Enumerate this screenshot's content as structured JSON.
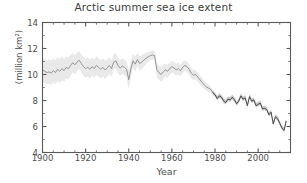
{
  "chart_data": {
    "type": "line",
    "title": "Arctic summer sea ice extent",
    "xlabel": "Year",
    "ylabel": "(million km²)",
    "xlim": [
      1900,
      2015
    ],
    "ylim": [
      4,
      14
    ],
    "xticks": [
      1900,
      1920,
      1940,
      1960,
      1980,
      2000
    ],
    "xtick_labels": [
      "1900",
      "1920",
      "1940",
      "1960",
      "1980",
      "2000"
    ],
    "yticks": [
      4,
      6,
      8,
      10,
      12,
      14
    ],
    "ytick_labels": [
      "4",
      "6",
      "8",
      "10",
      "12",
      "14"
    ],
    "minor_xtick_interval": 5,
    "minor_ytick_interval": 1,
    "grid": false,
    "legend": null,
    "series": [
      {
        "name": "Arctic summer sea ice extent",
        "style": "line-with-uncertainty-band",
        "line_color": "#8c8c8c",
        "line_color_recent": "#4a4a4a",
        "band_color": "#c9c9c9",
        "band_opacity": 0.45,
        "recent_period_start": 1979,
        "x": [
          1900,
          1901,
          1902,
          1903,
          1904,
          1905,
          1906,
          1907,
          1908,
          1909,
          1910,
          1911,
          1912,
          1913,
          1914,
          1915,
          1916,
          1917,
          1918,
          1919,
          1920,
          1921,
          1922,
          1923,
          1924,
          1925,
          1926,
          1927,
          1928,
          1929,
          1930,
          1931,
          1932,
          1933,
          1934,
          1935,
          1936,
          1937,
          1938,
          1939,
          1940,
          1941,
          1942,
          1943,
          1944,
          1945,
          1946,
          1947,
          1948,
          1949,
          1950,
          1951,
          1952,
          1953,
          1954,
          1955,
          1956,
          1957,
          1958,
          1959,
          1960,
          1961,
          1962,
          1963,
          1964,
          1965,
          1966,
          1967,
          1968,
          1969,
          1970,
          1971,
          1972,
          1973,
          1974,
          1975,
          1976,
          1977,
          1978,
          1979,
          1980,
          1981,
          1982,
          1983,
          1984,
          1985,
          1986,
          1987,
          1988,
          1989,
          1990,
          1991,
          1992,
          1993,
          1994,
          1995,
          1996,
          1997,
          1998,
          1999,
          2000,
          2001,
          2002,
          2003,
          2004,
          2005,
          2006,
          2007,
          2008,
          2009,
          2010,
          2011,
          2012,
          2013
        ],
        "values": [
          10.35,
          10.25,
          10.15,
          10.2,
          10.1,
          10.3,
          10.15,
          10.4,
          10.25,
          10.45,
          10.3,
          10.55,
          10.45,
          10.7,
          10.9,
          10.75,
          10.95,
          11.1,
          10.85,
          10.6,
          10.45,
          10.55,
          10.4,
          10.6,
          10.45,
          10.7,
          10.55,
          10.4,
          10.55,
          10.35,
          10.5,
          10.7,
          10.45,
          10.95,
          11.05,
          10.7,
          10.5,
          10.65,
          10.55,
          10.4,
          9.6,
          10.45,
          11.05,
          10.8,
          11.15,
          10.85,
          10.95,
          11.1,
          11.25,
          11.35,
          11.45,
          11.5,
          11.45,
          10.35,
          10.15,
          10.0,
          10.2,
          10.35,
          10.25,
          10.45,
          10.6,
          10.5,
          10.35,
          10.45,
          10.3,
          10.55,
          10.7,
          10.6,
          10.4,
          10.1,
          9.95,
          10.0,
          9.8,
          9.6,
          9.4,
          9.2,
          9.05,
          8.95,
          8.85,
          8.6,
          8.45,
          8.15,
          8.35,
          8.25,
          7.95,
          7.85,
          8.1,
          8.05,
          8.25,
          8.05,
          7.75,
          7.95,
          8.35,
          8.1,
          8.2,
          7.6,
          8.3,
          7.95,
          8.05,
          7.6,
          7.7,
          7.8,
          7.35,
          7.4,
          7.3,
          6.9,
          7.1,
          6.2,
          6.75,
          6.6,
          6.25,
          5.9,
          5.7,
          6.4
        ],
        "band_upper": [
          11.3,
          11.2,
          11.1,
          11.15,
          11.05,
          11.25,
          11.1,
          11.35,
          11.2,
          11.4,
          11.2,
          11.4,
          11.3,
          11.5,
          11.65,
          11.5,
          11.65,
          11.8,
          11.55,
          11.35,
          11.2,
          11.3,
          11.15,
          11.3,
          11.15,
          11.4,
          11.25,
          11.1,
          11.25,
          11.05,
          11.15,
          11.35,
          11.1,
          11.55,
          11.65,
          11.3,
          11.1,
          11.25,
          11.15,
          11.0,
          10.35,
          11.1,
          11.6,
          11.4,
          11.65,
          11.4,
          11.5,
          11.6,
          11.7,
          11.75,
          11.8,
          11.85,
          11.8,
          10.9,
          10.7,
          10.55,
          10.75,
          10.85,
          10.75,
          10.9,
          11.05,
          10.95,
          10.8,
          10.9,
          10.75,
          11.0,
          11.1,
          11.0,
          10.8,
          10.5,
          10.35,
          10.35,
          10.15,
          9.95,
          9.75,
          9.5,
          9.35,
          9.25,
          9.1,
          8.8,
          8.6,
          8.35,
          8.55,
          8.45,
          8.15,
          8.05,
          8.3,
          8.25,
          8.45,
          8.25,
          7.95,
          8.15,
          8.55,
          8.3,
          8.4,
          7.8,
          8.5,
          8.15,
          8.25,
          7.8,
          7.9,
          8.0,
          7.55,
          7.6,
          7.5,
          7.1,
          7.3,
          6.4,
          6.95,
          6.8,
          6.45,
          6.1,
          5.9,
          6.6
        ],
        "band_lower": [
          9.4,
          9.35,
          9.25,
          9.3,
          9.2,
          9.4,
          9.25,
          9.5,
          9.35,
          9.55,
          9.45,
          9.7,
          9.6,
          9.9,
          10.15,
          10.0,
          10.25,
          10.4,
          10.15,
          9.9,
          9.75,
          9.85,
          9.7,
          9.9,
          9.75,
          10.0,
          9.85,
          9.7,
          9.85,
          9.65,
          9.85,
          10.05,
          9.8,
          10.35,
          10.45,
          10.1,
          9.9,
          10.05,
          9.95,
          9.8,
          8.85,
          9.8,
          10.5,
          10.2,
          10.65,
          10.3,
          10.4,
          10.6,
          10.8,
          10.95,
          11.1,
          11.15,
          11.1,
          9.8,
          9.6,
          9.45,
          9.65,
          9.85,
          9.75,
          9.95,
          10.15,
          10.05,
          9.9,
          10.0,
          9.85,
          10.1,
          10.3,
          10.2,
          10.0,
          9.7,
          9.55,
          9.65,
          9.45,
          9.25,
          9.05,
          8.9,
          8.75,
          8.65,
          8.6,
          8.4,
          8.3,
          8.0,
          8.2,
          8.1,
          7.8,
          7.7,
          7.95,
          7.9,
          8.1,
          7.9,
          7.6,
          7.8,
          8.2,
          7.95,
          8.05,
          7.45,
          8.15,
          7.8,
          7.9,
          7.45,
          7.55,
          7.65,
          7.2,
          7.25,
          7.15,
          6.75,
          6.95,
          6.05,
          6.6,
          6.45,
          6.1,
          5.75,
          5.55,
          6.25
        ]
      }
    ]
  },
  "axes": {
    "frame_color": "#5a5a5a",
    "tick_color": "#5a5a5a"
  }
}
